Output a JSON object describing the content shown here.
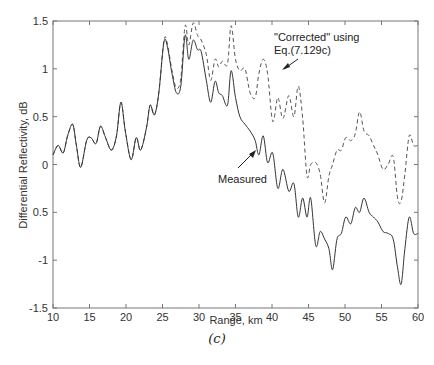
{
  "chart_data": {
    "type": "line",
    "title": "",
    "xlabel": "Range, km",
    "ylabel": "Differential Reflectivity, dB",
    "xlim": [
      10,
      60
    ],
    "ylim": [
      -1.5,
      1.5
    ],
    "xticks": [
      10,
      15,
      20,
      25,
      30,
      35,
      40,
      45,
      50,
      55,
      60
    ],
    "yticks": [
      -1.5,
      -1,
      -0.5,
      0,
      0.5,
      1,
      1.5
    ],
    "ytick_labels": [
      "-1.5",
      "-1",
      "0.5",
      "0",
      "0.5",
      "1",
      "1.5"
    ],
    "grid": false,
    "legend": null,
    "caption": "(c)",
    "annotations": [
      {
        "text": "\"Corrected\" using",
        "line2": "Eq.(7.129c)",
        "arrow_to": [
          41.7,
          1.1
        ]
      },
      {
        "text": "Measured",
        "arrow_to": [
          39.0,
          0.27
        ]
      }
    ],
    "series": [
      {
        "name": "Measured",
        "style": "solid",
        "x": [
          10,
          10.7,
          11.4,
          12.0,
          12.7,
          13.2,
          13.8,
          14.6,
          15.2,
          15.9,
          16.5,
          17.2,
          18.0,
          18.7,
          19.3,
          19.9,
          20.7,
          21.4,
          22.0,
          22.8,
          23.3,
          23.9,
          24.5,
          25.2,
          25.7,
          26.3,
          26.9,
          27.5,
          28.1,
          28.6,
          29.2,
          29.8,
          30.3,
          31.0,
          31.6,
          32.2,
          32.7,
          33.2,
          33.9,
          34.4,
          35.0,
          35.6,
          36.3,
          37.0,
          37.7,
          38.2,
          38.8,
          39.4,
          40.1,
          40.8,
          41.5,
          42.3,
          43.0,
          43.6,
          44.2,
          44.8,
          45.3,
          46.0,
          46.6,
          47.2,
          47.8,
          48.3,
          48.9,
          49.5,
          50.1,
          50.8,
          51.4,
          52.0,
          52.6,
          53.3,
          53.9,
          54.5,
          55.2,
          55.9,
          56.6,
          57.2,
          57.7,
          58.2,
          58.8,
          59.4,
          60
        ],
        "y": [
          0.1,
          0.2,
          0.12,
          0.3,
          0.42,
          0.2,
          -0.03,
          0.25,
          0.28,
          0.22,
          0.4,
          0.28,
          0.15,
          0.3,
          0.65,
          0.35,
          0.05,
          0.28,
          0.15,
          0.38,
          0.62,
          0.52,
          0.75,
          1.28,
          1.22,
          0.95,
          0.75,
          0.82,
          1.35,
          1.1,
          1.3,
          1.2,
          1.18,
          0.88,
          0.65,
          0.87,
          0.75,
          0.72,
          0.62,
          0.98,
          0.7,
          0.5,
          0.42,
          0.35,
          0.25,
          0.1,
          0.3,
          0.02,
          0.12,
          -0.25,
          -0.05,
          -0.28,
          -0.2,
          -0.55,
          -0.35,
          -0.55,
          -0.35,
          -0.85,
          -0.7,
          -0.78,
          -0.88,
          -1.1,
          -0.78,
          -0.72,
          -0.55,
          -0.62,
          -0.45,
          -0.5,
          -0.35,
          -0.5,
          -0.55,
          -0.6,
          -0.7,
          -0.72,
          -0.78,
          -1.08,
          -1.25,
          -0.88,
          -0.55,
          -0.72,
          -0.72
        ]
      },
      {
        "name": "\"Corrected\" using Eq.(7.129c)",
        "style": "dashed",
        "x": [
          10,
          10.7,
          11.4,
          12.0,
          12.7,
          13.2,
          13.8,
          14.6,
          15.2,
          15.9,
          16.5,
          17.2,
          18.0,
          18.7,
          19.3,
          19.9,
          20.7,
          21.4,
          22.0,
          22.8,
          23.3,
          23.9,
          24.5,
          25.2,
          25.7,
          26.3,
          26.9,
          27.5,
          28.1,
          28.6,
          29.2,
          29.8,
          30.3,
          31.0,
          31.6,
          32.2,
          32.7,
          33.2,
          33.9,
          34.4,
          35.0,
          35.6,
          36.3,
          37.0,
          37.7,
          38.2,
          38.8,
          39.4,
          40.1,
          40.8,
          41.5,
          42.3,
          43.0,
          43.6,
          44.2,
          44.8,
          45.3,
          46.0,
          46.6,
          47.2,
          47.8,
          48.3,
          48.9,
          49.5,
          50.1,
          50.8,
          51.4,
          52.0,
          52.6,
          53.3,
          53.9,
          54.5,
          55.2,
          55.9,
          56.6,
          57.2,
          57.7,
          58.2,
          58.8,
          59.4,
          60
        ],
        "y": [
          0.1,
          0.2,
          0.12,
          0.3,
          0.42,
          0.2,
          -0.03,
          0.25,
          0.28,
          0.22,
          0.4,
          0.28,
          0.15,
          0.3,
          0.65,
          0.35,
          0.05,
          0.28,
          0.15,
          0.38,
          0.62,
          0.52,
          0.75,
          1.3,
          1.25,
          0.98,
          0.8,
          0.9,
          1.45,
          1.25,
          1.48,
          1.35,
          1.3,
          1.15,
          0.88,
          1.1,
          1.02,
          1.08,
          1.05,
          1.45,
          1.1,
          0.98,
          1.0,
          0.75,
          0.7,
          0.95,
          1.1,
          0.95,
          0.45,
          0.7,
          0.48,
          0.72,
          0.5,
          0.82,
          0.48,
          -0.12,
          0.0,
          0.02,
          -0.1,
          -0.4,
          -0.12,
          0.0,
          0.15,
          0.15,
          0.28,
          0.25,
          0.32,
          0.55,
          0.35,
          0.3,
          0.2,
          0.1,
          -0.05,
          0.0,
          0.08,
          -0.35,
          -0.38,
          -0.1,
          0.3,
          0.2,
          0.2
        ]
      }
    ]
  }
}
